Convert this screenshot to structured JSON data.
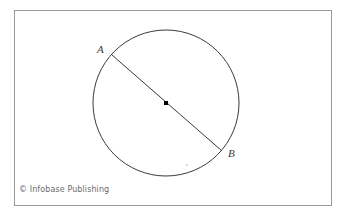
{
  "figure": {
    "caption_credit": "© Infobase Publishing",
    "frame": {
      "x": 14,
      "y": 10,
      "width": 318,
      "height": 196,
      "stroke_color": "#9a9a9a",
      "fill_color": "#ffffff"
    },
    "labels": {
      "point_a": "A",
      "point_b": "B"
    },
    "colors": {
      "stroke": "#3a3a3a",
      "center_dot": "#000000",
      "background": "#ffffff",
      "credit_text": "#6b6b6b"
    }
  },
  "chart_data": {
    "type": "diagram",
    "title": "",
    "subtitle": "",
    "shapes": [
      {
        "name": "circle",
        "kind": "circle",
        "cx": 166,
        "cy": 103,
        "r": 73,
        "stroke": "#3a3a3a",
        "stroke_width": 1,
        "fill": "none"
      },
      {
        "name": "diameter-AB",
        "kind": "line",
        "x1": 112,
        "y1": 55,
        "x2": 222,
        "y2": 151,
        "stroke": "#3a3a3a",
        "stroke_width": 1
      },
      {
        "name": "center-point",
        "kind": "point",
        "cx": 166,
        "cy": 103,
        "size": 4,
        "fill": "#000000"
      }
    ],
    "annotations": [
      {
        "text": "A",
        "x": 99,
        "y": 50,
        "anchor": "point-a",
        "style": "italic-serif"
      },
      {
        "text": "B",
        "x": 230,
        "y": 154,
        "anchor": "point-b",
        "style": "italic-serif"
      }
    ],
    "legend": [],
    "grid": false
  }
}
